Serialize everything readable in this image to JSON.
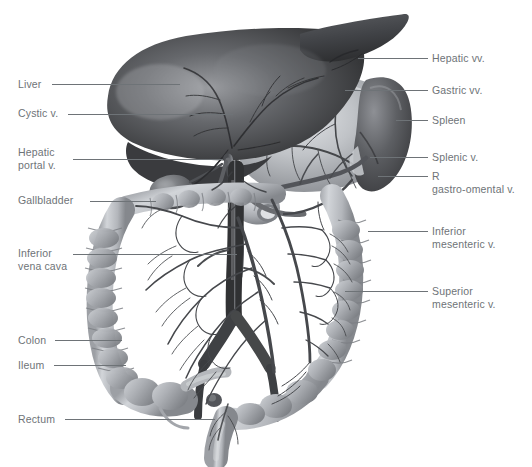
{
  "figure": {
    "background_color": "#ffffff",
    "label_color": "#6e7377",
    "leader_color": "#6e7377",
    "width": 532,
    "height": 467
  },
  "labels_left": [
    {
      "id": "liver",
      "text": "Liver",
      "x": 18,
      "y": 78,
      "leader_x": 52,
      "leader_y": 84,
      "leader_w": 128
    },
    {
      "id": "cystic-v",
      "text": "Cystic v.",
      "x": 18,
      "y": 107,
      "leader_x": 68,
      "leader_y": 114,
      "leader_w": 165
    },
    {
      "id": "hepatic-portal",
      "text": "Hepatic\nportal v.",
      "x": 18,
      "y": 146,
      "leader_x": 73,
      "leader_y": 159,
      "leader_w": 150
    },
    {
      "id": "gallbladder",
      "text": "Gallbladder",
      "x": 18,
      "y": 194,
      "leader_x": 90,
      "leader_y": 201,
      "leader_w": 66
    },
    {
      "id": "inferior-vena",
      "text": "Inferior\nvena cava",
      "x": 18,
      "y": 247,
      "leader_x": 73,
      "leader_y": 254,
      "leader_w": 164
    },
    {
      "id": "colon",
      "text": "Colon",
      "x": 18,
      "y": 334,
      "leader_x": 55,
      "leader_y": 340,
      "leader_w": 67
    },
    {
      "id": "ileum",
      "text": "Ileum",
      "x": 18,
      "y": 359,
      "leader_x": 54,
      "leader_y": 365,
      "leader_w": 72
    },
    {
      "id": "rectum",
      "text": "Rectum",
      "x": 18,
      "y": 413,
      "leader_x": 65,
      "leader_y": 419,
      "leader_w": 150
    }
  ],
  "labels_right": [
    {
      "id": "hepatic-vv",
      "text": "Hepatic vv.",
      "x": 432,
      "y": 52,
      "leader_x": 358,
      "leader_y": 58,
      "leader_w": 70
    },
    {
      "id": "gastric-vv",
      "text": "Gastric vv.",
      "x": 432,
      "y": 84,
      "leader_x": 345,
      "leader_y": 90,
      "leader_w": 83
    },
    {
      "id": "spleen",
      "text": "Spleen",
      "x": 432,
      "y": 114,
      "leader_x": 396,
      "leader_y": 120,
      "leader_w": 32
    },
    {
      "id": "splenic-v",
      "text": "Splenic v.",
      "x": 432,
      "y": 151,
      "leader_x": 370,
      "leader_y": 157,
      "leader_w": 58
    },
    {
      "id": "r-gastro",
      "text": "R\ngastro-omental v.",
      "x": 432,
      "y": 170,
      "leader_x": 378,
      "leader_y": 176,
      "leader_w": 50
    },
    {
      "id": "inferior-mes-v",
      "text": "Inferior\nmesenteric v.",
      "x": 432,
      "y": 225,
      "leader_x": 368,
      "leader_y": 231,
      "leader_w": 60
    },
    {
      "id": "superior-mes-v",
      "text": "Superior\nmesenteric v.",
      "x": 432,
      "y": 285,
      "leader_x": 345,
      "leader_y": 291,
      "leader_w": 83
    }
  ],
  "organs": [
    {
      "id": "liver",
      "name": "Liver",
      "tone_dark": "#3b3c3e",
      "tone_light": "#9a9ca0"
    },
    {
      "id": "stomach",
      "name": "Stomach",
      "tone_dark": "#8a8d91",
      "tone_light": "#d4d6d9"
    },
    {
      "id": "spleen",
      "name": "Spleen",
      "tone_dark": "#4e5053",
      "tone_light": "#8e9095"
    },
    {
      "id": "colon",
      "name": "Colon",
      "tone_dark": "#8b8e93",
      "tone_light": "#cfd2d6"
    },
    {
      "id": "rectum",
      "name": "Rectum",
      "tone_dark": "#8b8e93",
      "tone_light": "#c9ccd0"
    },
    {
      "id": "vena-cava",
      "name": "Inferior vena cava",
      "tone_dark": "#44464a",
      "tone_light": "#747679"
    },
    {
      "id": "portal-vein",
      "name": "Hepatic portal vein",
      "tone_dark": "#5a5d61",
      "tone_light": "#8b8e93"
    }
  ]
}
